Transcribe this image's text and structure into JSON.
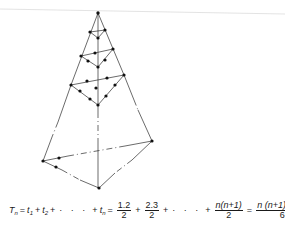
{
  "figure": {
    "colors": {
      "line": "#2b2b2b",
      "point": "#111111",
      "top_rule": "#d9d9d9",
      "background": "#ffffff"
    }
  },
  "formula": {
    "lhs_T": "T",
    "lhs_sub": "n",
    "eq1": "=",
    "t1": "t",
    "t1_sub": "1",
    "plus1": "+",
    "t2": "t",
    "t2_sub": "2",
    "plus2": "+",
    "ellipsis1": "· · ·",
    "plus3": "+",
    "tn": "t",
    "tn_sub": "n",
    "eq2": "=",
    "frac1_num": "1.2",
    "frac1_den": "2",
    "plus4": "+",
    "frac2_num": "2.3",
    "frac2_den": "2",
    "plus5": "+",
    "ellipsis2": "· · ·",
    "plus6": "+",
    "frac3_num": "n(n+1)",
    "frac3_den": "2",
    "eq3": "=",
    "frac4_num": "n (n+1)(n+2)",
    "frac4_den": "6"
  }
}
